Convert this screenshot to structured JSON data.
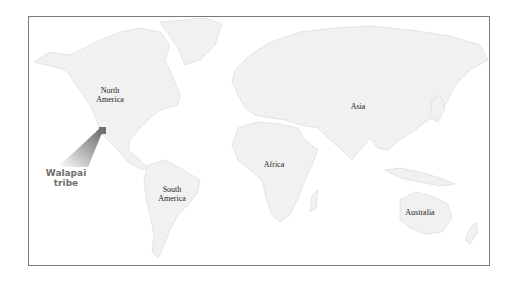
{
  "map": {
    "continents": [
      {
        "id": "north-america",
        "label": "North America",
        "lines": [
          "North",
          "America"
        ]
      },
      {
        "id": "south-america",
        "label": "South America",
        "lines": [
          "South",
          "America"
        ]
      },
      {
        "id": "africa",
        "label": "Africa",
        "lines": [
          "Africa"
        ]
      },
      {
        "id": "asia",
        "label": "Asia",
        "lines": [
          "Asia"
        ]
      },
      {
        "id": "australia",
        "label": "Australia",
        "lines": [
          "Australia"
        ]
      }
    ],
    "callout": {
      "lines": [
        "Walapai",
        "tribe"
      ],
      "color": "#6e6e6e"
    },
    "colors": {
      "land": "#f1f1f1",
      "border": "#d6d6d6",
      "frame": "#7a7a7a",
      "marker": "#707070"
    }
  }
}
